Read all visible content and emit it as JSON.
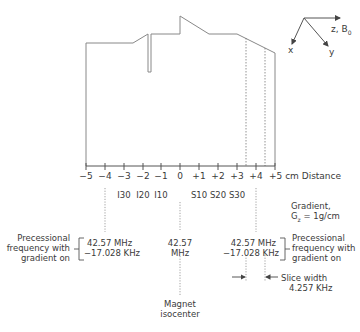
{
  "axes": {
    "label": "z, B",
    "label_sub": "0",
    "x_label": "x",
    "y_label": "y"
  },
  "distance_axis": {
    "ticks": [
      "−5",
      "−4",
      "−3",
      "−2",
      "−1",
      "0",
      "+1",
      "+2",
      "+3",
      "+4",
      "+5 cm Distance"
    ],
    "segment_labels": [
      "I30",
      "I20",
      "I10",
      "S10",
      "S20",
      "S30"
    ]
  },
  "gradient": {
    "line1": "Gradient,",
    "line2_pre": "G",
    "line2_sub": "z",
    "line2_post": " = 1g/cm"
  },
  "left_annotation": {
    "caption": [
      "Precessional",
      "frequency with",
      "gradient on"
    ],
    "value_line1": "42.57 MHz",
    "value_line2": "−17.028 KHz"
  },
  "center_annotation": {
    "value_line1": "42.57",
    "value_line2": "MHz",
    "caption": [
      "Magnet",
      "isocenter"
    ]
  },
  "right_annotation": {
    "caption": [
      "Precessional",
      "frequency with",
      "gradient on"
    ],
    "value_line1": "42.57 MHz",
    "value_line2": "−17.028 KHz"
  },
  "slice_width": {
    "line1": "Slice width",
    "line2": "4.257 KHz"
  }
}
